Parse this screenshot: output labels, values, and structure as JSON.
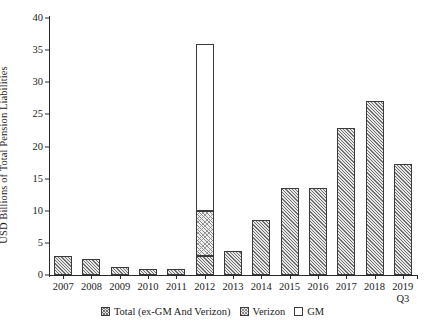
{
  "chart_data": {
    "type": "bar",
    "title": "",
    "subtitle": "",
    "xlabel": "",
    "ylabel": "USD Billions of Total Pension Liabilities",
    "ylim": [
      0,
      40
    ],
    "yticks": [
      0,
      5,
      10,
      15,
      20,
      25,
      30,
      35,
      40
    ],
    "ytick_labels": [
      "0",
      "5",
      "10",
      "15",
      "20",
      "25",
      "30",
      "35",
      "40"
    ],
    "grid": false,
    "stacked": true,
    "legend_position": "bottom",
    "categories": [
      "2007",
      "2008",
      "2009",
      "2010",
      "2011",
      "2012",
      "2013",
      "2014",
      "2015",
      "2016",
      "2017",
      "2018",
      "2019 Q3"
    ],
    "category_labels": [
      {
        "main": "2007",
        "sub": ""
      },
      {
        "main": "2008",
        "sub": ""
      },
      {
        "main": "2009",
        "sub": ""
      },
      {
        "main": "2010",
        "sub": ""
      },
      {
        "main": "2011",
        "sub": ""
      },
      {
        "main": "2012",
        "sub": ""
      },
      {
        "main": "2013",
        "sub": ""
      },
      {
        "main": "2014",
        "sub": ""
      },
      {
        "main": "2015",
        "sub": ""
      },
      {
        "main": "2016",
        "sub": ""
      },
      {
        "main": "2017",
        "sub": ""
      },
      {
        "main": "2018",
        "sub": ""
      },
      {
        "main": "2019",
        "sub": "Q3"
      }
    ],
    "series": [
      {
        "name": "Total (ex-GM And Verizon)",
        "key": "total",
        "values": [
          3.0,
          2.5,
          1.3,
          0.9,
          0.9,
          3.0,
          3.8,
          8.6,
          13.6,
          13.6,
          22.9,
          27.1,
          17.3
        ]
      },
      {
        "name": "Verizon",
        "key": "verizon",
        "values": [
          0,
          0,
          0,
          0,
          0,
          7.0,
          0,
          0,
          0,
          0,
          0,
          0,
          0
        ]
      },
      {
        "name": "GM",
        "key": "gm",
        "values": [
          0,
          0,
          0,
          0,
          0,
          26.0,
          0,
          0,
          0,
          0,
          0,
          0,
          0
        ]
      }
    ],
    "totals": [
      3.0,
      2.5,
      1.3,
      0.9,
      0.9,
      36.0,
      3.8,
      8.6,
      13.6,
      13.6,
      22.9,
      27.1,
      17.3
    ]
  },
  "legend": {
    "items": [
      {
        "label": "Total (ex-GM And Verizon)",
        "swatch": "crosshatch-dark"
      },
      {
        "label": "Verizon",
        "swatch": "crosshatch-light"
      },
      {
        "label": "GM",
        "swatch": "empty-white"
      }
    ]
  }
}
